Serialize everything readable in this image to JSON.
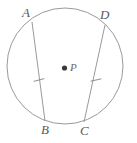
{
  "figure": {
    "kind": "circle-with-two-congruent-chords",
    "width": 137,
    "height": 143,
    "background_color": "#ffffff",
    "stroke_color": "#9a9a9a",
    "label_color": "#5a5a5a",
    "center_dot_color": "#3a3a3a",
    "circle": {
      "name": "circle-P",
      "center": {
        "x": 65,
        "y": 66
      },
      "radius": 58,
      "stroke_width": 1
    },
    "center_point": {
      "name": "P",
      "label": "P",
      "dot": {
        "x": 64.5,
        "y": 68,
        "r": 2.6
      }
    },
    "points": [
      {
        "name": "A",
        "label": "A",
        "x": 32,
        "y": 22
      },
      {
        "name": "B",
        "label": "B",
        "x": 45,
        "y": 121
      },
      {
        "name": "C",
        "label": "C",
        "x": 84,
        "y": 122
      },
      {
        "name": "D",
        "label": "D",
        "x": 105,
        "y": 25
      }
    ],
    "chords": [
      {
        "name": "chord-AB",
        "from": "A",
        "to": "B",
        "x1": 32,
        "y1": 22,
        "x2": 45,
        "y2": 121,
        "tick_marks": 1,
        "tick": {
          "x": 39,
          "y": 80,
          "length": 11,
          "angle_deg": 97
        }
      },
      {
        "name": "chord-DC",
        "from": "D",
        "to": "C",
        "x1": 105,
        "y1": 25,
        "x2": 84,
        "y2": 122,
        "tick_marks": 1,
        "tick": {
          "x": 96,
          "y": 80,
          "length": 11,
          "angle_deg": 78
        }
      }
    ],
    "annotations": {
      "congruence_note": "Single tick mark on each chord indicates AB is congruent to DC"
    }
  }
}
